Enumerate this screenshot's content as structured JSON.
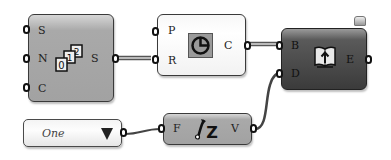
{
  "canvas": {
    "background": "#ffffff",
    "wire_color": "#4a4a4a"
  },
  "nodes": [
    {
      "id": "series",
      "style": "grey",
      "icon": "number-sequence-icon",
      "inputs": [
        "S",
        "N",
        "C"
      ],
      "outputs": [
        "S"
      ]
    },
    {
      "id": "circle",
      "style": "white",
      "icon": "circle-pie-icon",
      "inputs": [
        "P",
        "R"
      ],
      "outputs": [
        "C"
      ]
    },
    {
      "id": "bake",
      "style": "dark",
      "icon": "book-upload-icon",
      "inputs": [
        "B",
        "D"
      ],
      "outputs": [
        "E"
      ]
    },
    {
      "id": "expression",
      "style": "grey",
      "icon": "function-fz-icon",
      "inputs": [
        "F"
      ],
      "outputs": [
        "V"
      ]
    }
  ],
  "value_list": {
    "selected": "One",
    "icon": "dropdown-arrow-icon"
  },
  "icons": {
    "number_glyphs": [
      "0",
      "1",
      "2"
    ],
    "fz_text": "Z"
  }
}
